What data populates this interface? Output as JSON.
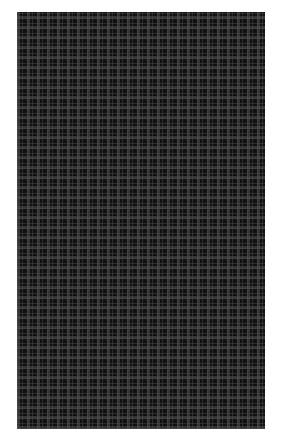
{
  "image": {
    "subject": "dark plaid fabric swatch",
    "colors": {
      "background": "#ffffff",
      "base": "#111111",
      "stripe": "#3a3a3a"
    },
    "pattern_period_px": 10
  }
}
